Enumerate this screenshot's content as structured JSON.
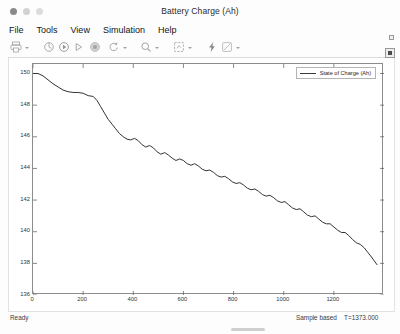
{
  "window": {
    "title": "Battery Charge (Ah)",
    "traffic_lights": [
      "close",
      "minimize",
      "maximize"
    ]
  },
  "menubar": {
    "items": [
      {
        "label": "File"
      },
      {
        "label": "Tools"
      },
      {
        "label": "View"
      },
      {
        "label": "Simulation"
      },
      {
        "label": "Help"
      }
    ],
    "overflow_icon": "chevron-down-icon"
  },
  "toolbar": {
    "buttons": [
      {
        "name": "print-icon",
        "has_caret": true
      },
      {
        "name": "configuration-properties-icon",
        "has_caret": false
      },
      {
        "name": "run-icon",
        "has_caret": false
      },
      {
        "name": "step-forward-icon",
        "has_caret": false
      },
      {
        "name": "stop-icon",
        "has_caret": false
      },
      {
        "name": "restore-view-icon",
        "has_caret": true
      },
      {
        "name": "zoom-icon",
        "has_caret": true
      },
      {
        "name": "autoscale-icon",
        "has_caret": true
      },
      {
        "name": "trigger-icon",
        "has_caret": false
      },
      {
        "name": "measurements-icon",
        "has_caret": true
      }
    ]
  },
  "plot": {
    "legend_label": "State of Charge (Ah)",
    "corner_button": "maximize-axes-icon",
    "line_color": "#333333"
  },
  "statusbar": {
    "ready_text": "Ready",
    "sample_mode": "Sample based",
    "time_text": "T=1373.000"
  },
  "chart_data": {
    "type": "line",
    "title": "",
    "xlabel": "",
    "ylabel": "",
    "xlim": [
      0,
      1400
    ],
    "ylim": [
      136,
      150.6
    ],
    "xticks": [
      0,
      200,
      400,
      600,
      800,
      1000,
      1200
    ],
    "yticks": [
      136,
      138,
      140,
      142,
      144,
      146,
      148,
      150
    ],
    "grid": false,
    "legend": [
      "State of Charge (Ah)"
    ],
    "legend_position": "top-right",
    "series": [
      {
        "name": "State of Charge (Ah)",
        "x": [
          0,
          20,
          40,
          60,
          80,
          100,
          120,
          140,
          160,
          180,
          200,
          220,
          240,
          255,
          270,
          285,
          300,
          315,
          330,
          345,
          360,
          375,
          390,
          405,
          420,
          435,
          450,
          465,
          480,
          495,
          510,
          525,
          540,
          555,
          570,
          585,
          600,
          615,
          630,
          645,
          660,
          675,
          690,
          705,
          720,
          735,
          750,
          765,
          780,
          795,
          810,
          825,
          840,
          855,
          870,
          885,
          900,
          915,
          930,
          945,
          960,
          975,
          990,
          1005,
          1020,
          1035,
          1050,
          1065,
          1080,
          1095,
          1110,
          1125,
          1140,
          1155,
          1170,
          1185,
          1200,
          1215,
          1230,
          1245,
          1260,
          1275,
          1290,
          1305,
          1320,
          1335,
          1350,
          1373
        ],
        "y": [
          150.0,
          150.0,
          149.85,
          149.6,
          149.35,
          149.15,
          148.95,
          148.85,
          148.8,
          148.8,
          148.75,
          148.6,
          148.55,
          148.3,
          147.9,
          147.5,
          147.1,
          146.8,
          146.5,
          146.2,
          146.0,
          145.85,
          145.8,
          145.9,
          145.75,
          145.5,
          145.35,
          145.45,
          145.3,
          145.05,
          144.9,
          145.0,
          144.85,
          144.65,
          144.5,
          144.6,
          144.5,
          144.3,
          144.2,
          144.3,
          144.15,
          143.95,
          143.85,
          143.9,
          143.75,
          143.55,
          143.45,
          143.5,
          143.35,
          143.15,
          143.05,
          143.1,
          142.95,
          142.75,
          142.65,
          142.7,
          142.55,
          142.35,
          142.25,
          142.3,
          142.15,
          141.95,
          141.85,
          141.9,
          141.7,
          141.5,
          141.4,
          141.45,
          141.25,
          141.05,
          140.95,
          141.0,
          140.8,
          140.6,
          140.5,
          140.5,
          140.3,
          140.1,
          139.95,
          139.95,
          139.75,
          139.5,
          139.3,
          139.2,
          139.0,
          138.7,
          138.4,
          137.9
        ]
      }
    ]
  }
}
